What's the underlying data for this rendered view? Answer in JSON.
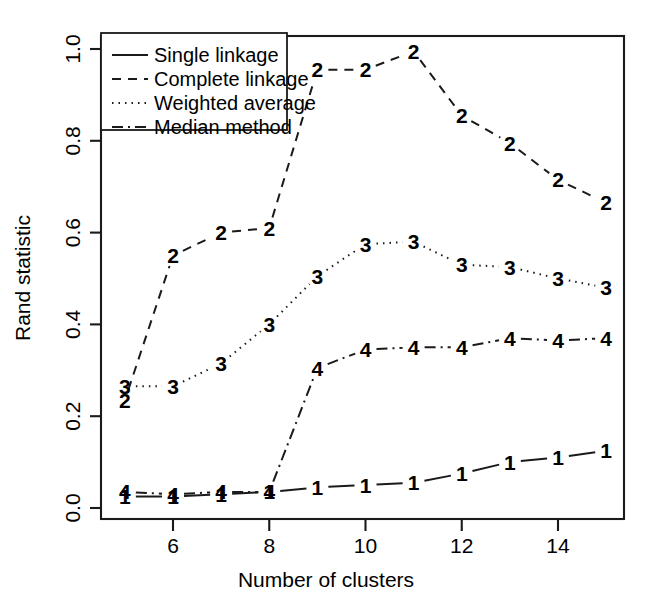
{
  "chart_data": {
    "type": "line",
    "title": "",
    "xlabel": "Number of clusters",
    "ylabel": "Rand statistic",
    "xlim": [
      4.6,
      15.4
    ],
    "ylim": [
      -0.02,
      1.04
    ],
    "grid": false,
    "legend_position": "top-left",
    "x": [
      5,
      6,
      7,
      8,
      9,
      10,
      11,
      12,
      13,
      14,
      15
    ],
    "xticks": [
      6,
      8,
      10,
      12,
      14
    ],
    "xticklabels": [
      "6",
      "8",
      "10",
      "12",
      "14"
    ],
    "yticks": [
      0.0,
      0.2,
      0.4,
      0.6,
      0.8,
      1.0
    ],
    "yticklabels": [
      "0.0",
      "0.2",
      "0.4",
      "0.6",
      "0.8",
      "1.0"
    ],
    "point_marker_style": "series number digit",
    "series": [
      {
        "name": "Single linkage",
        "marker": "1",
        "linestyle": "solid",
        "dash": "none",
        "values": [
          0.025,
          0.025,
          0.03,
          0.035,
          0.045,
          0.05,
          0.055,
          0.075,
          0.1,
          0.11,
          0.125
        ]
      },
      {
        "name": "Complete linkage",
        "marker": "2",
        "linestyle": "dashed",
        "dash": "9,7",
        "values": [
          0.235,
          0.55,
          0.6,
          0.61,
          0.955,
          0.955,
          0.995,
          0.855,
          0.795,
          0.715,
          0.665
        ]
      },
      {
        "name": "Weighted average",
        "marker": "3",
        "linestyle": "dotted",
        "dash": "1.5,5",
        "values": [
          0.265,
          0.265,
          0.315,
          0.4,
          0.505,
          0.575,
          0.58,
          0.53,
          0.525,
          0.5,
          0.48
        ]
      },
      {
        "name": "Median method",
        "marker": "4",
        "linestyle": "dashdot",
        "dash": "11,5,2,5",
        "values": [
          0.035,
          0.03,
          0.035,
          0.035,
          0.305,
          0.345,
          0.35,
          0.35,
          0.37,
          0.365,
          0.37
        ]
      }
    ]
  },
  "legend": {
    "items": [
      {
        "label": "Single linkage"
      },
      {
        "label": "Complete linkage"
      },
      {
        "label": "Weighted average"
      },
      {
        "label": "Median method"
      }
    ]
  },
  "axes": {
    "x_title": "Number of clusters",
    "y_title": "Rand statistic",
    "x_tick_labels": [
      "6",
      "8",
      "10",
      "12",
      "14"
    ],
    "y_tick_labels": [
      "0.0",
      "0.2",
      "0.4",
      "0.6",
      "0.8",
      "1.0"
    ]
  }
}
